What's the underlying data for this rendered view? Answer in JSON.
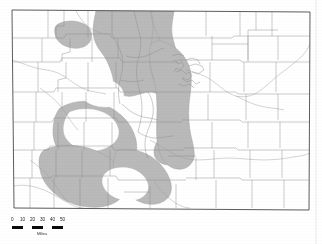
{
  "figure": {
    "kind": "map",
    "region": "Colorado"
  },
  "colors": {
    "background": "#ffffff",
    "shaded_region": "#b9b9b9",
    "shaded_region_edge": "#9a9a9a",
    "county_line": "#8c8c8c",
    "state_outline": "#4a4a4a",
    "river_line": "#9c9c9c",
    "scale_bar": "#0a0a0a",
    "text": "#1a1a1a"
  },
  "legend": {
    "scale_bar": {
      "tick_labels": [
        "0",
        "10",
        "20",
        "30",
        "40",
        "50"
      ],
      "caption": "Miles",
      "segments": 3
    }
  },
  "map_layers": [
    {
      "name": "state-outline",
      "label": "Colorado state boundary"
    },
    {
      "name": "county-boundaries",
      "label": "County boundaries"
    },
    {
      "name": "shaded-area",
      "label": "Shaded study area"
    },
    {
      "name": "rivers",
      "label": "Rivers and streams"
    }
  ]
}
